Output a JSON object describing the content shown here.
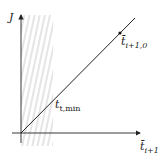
{
  "diagram": {
    "y_axis_label": "J",
    "x_axis_label": {
      "base": "t̄",
      "sub": "i+1"
    },
    "point_upper": {
      "base": "t̄",
      "sub": "i+1,0"
    },
    "point_lower": {
      "base": "t",
      "sub": "t,min"
    },
    "colors": {
      "line": "#222222",
      "hatch": "#cfcfcf",
      "axis": "#222222"
    }
  }
}
